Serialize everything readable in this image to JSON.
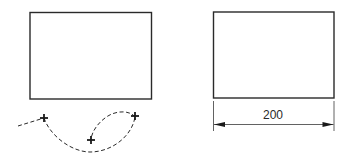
{
  "figure": {
    "left_panel": {
      "shape": "rectangle",
      "path_points": [
        {
          "label": "point-1",
          "marker": "+"
        },
        {
          "label": "point-2",
          "marker": "+"
        },
        {
          "label": "point-3",
          "marker": "+"
        }
      ],
      "curve_style": "dashed"
    },
    "right_panel": {
      "shape": "rectangle",
      "dimension": {
        "value": "200",
        "style": "double-arrow"
      }
    },
    "colors": {
      "stroke": "#2a2a2a",
      "background": "#ffffff"
    }
  }
}
